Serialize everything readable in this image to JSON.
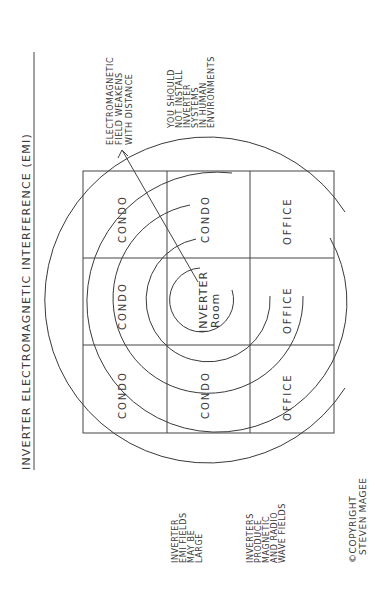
{
  "diagram": {
    "title": "INVERTER ELECTROMAGNETIC INTERFERENCE (EMI)",
    "grid": {
      "rows": [
        [
          "CONDO",
          "CONDO",
          "OFFICE"
        ],
        [
          "CONDO",
          "INVERTER",
          "OFFICE"
        ],
        [
          "CONDO",
          "CONDO",
          "OFFICE"
        ]
      ],
      "top_row_labels": [
        "CONDO",
        "CONDO",
        "CONDO"
      ],
      "middle_row_labels": [
        "CONDO",
        "INVERTER",
        "CONDO"
      ],
      "bottom_row_labels": [
        "OFFICE",
        "OFFICE",
        "OFFICE"
      ],
      "center_line1": "INVERTER",
      "center_line2": "Room"
    },
    "rings_count": 5,
    "arrow_note": {
      "line1": "ELECTROMAGNETIC",
      "line2": "FIELD WEAKENS",
      "line3": "WITH DISTANCE"
    },
    "warning_note": {
      "line1": "YOU SHOULD",
      "line2": "NOT INSTALL",
      "line3": "INVERTER",
      "line4": "SYSTEMS",
      "line5": "IN HUMAN",
      "line6": "ENVIRONMENTS"
    },
    "emi_note": {
      "line1": "INVERTER",
      "line2": "EMI FIELDS",
      "line3": "MAY BE",
      "line4": "LARGE"
    },
    "produce_note": {
      "line1": "INVERTERS",
      "line2": "PRODUCE",
      "line3": "MAGNETIC",
      "line4": "AND RADIO",
      "line5": "WAVE FIELDS"
    },
    "copyright": {
      "line1": "©COPYRIGHT",
      "line2": "STEVEN MAGEE"
    }
  }
}
